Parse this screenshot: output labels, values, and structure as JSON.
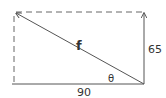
{
  "diagram": {
    "type": "vector-resolution",
    "labels": {
      "resultant": "f",
      "angle": "θ",
      "vertical_component": "65",
      "horizontal_component": "90"
    },
    "components": {
      "horizontal": 90,
      "vertical": 65
    },
    "colors": {
      "line": "#555555",
      "text": "#333333",
      "background": "#ffffff"
    }
  }
}
